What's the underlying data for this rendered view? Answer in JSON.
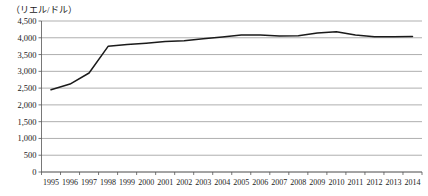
{
  "chart_data": {
    "type": "line",
    "title": "",
    "subtitle": "",
    "unit_label": "（リエル/ドル）",
    "xlabel": "",
    "ylabel": "",
    "grid": true,
    "legend": false,
    "legend_position": "none",
    "ylim": [
      0,
      4500
    ],
    "ytick_labels": [
      "4,500",
      "4,000",
      "3,500",
      "3,000",
      "2,500",
      "2,000",
      "1,500",
      "1,000",
      "500",
      "0"
    ],
    "ytick_values": [
      4500,
      4000,
      3500,
      3000,
      2500,
      2000,
      1500,
      1000,
      500,
      0
    ],
    "categories": [
      "1995",
      "1996",
      "1997",
      "1998",
      "1999",
      "2000",
      "2001",
      "2002",
      "2003",
      "2004",
      "2005",
      "2006",
      "2007",
      "2008",
      "2009",
      "2010",
      "2011",
      "2012",
      "2013",
      "2014"
    ],
    "x": [
      1995,
      1996,
      1997,
      1998,
      1999,
      2000,
      2001,
      2002,
      2003,
      2004,
      2005,
      2006,
      2007,
      2008,
      2009,
      2010,
      2011,
      2012,
      2013,
      2014
    ],
    "values": [
      2450,
      2620,
      2950,
      3745,
      3800,
      3840,
      3890,
      3910,
      3970,
      4020,
      4080,
      4080,
      4050,
      4060,
      4140,
      4180,
      4080,
      4030,
      4030,
      4040
    ],
    "series": [
      {
        "name": "リエル/ドル為替レート",
        "color": "#1a1a1a",
        "values": [
          2450,
          2620,
          2950,
          3745,
          3800,
          3840,
          3890,
          3910,
          3970,
          4020,
          4080,
          4080,
          4050,
          4060,
          4140,
          4180,
          4080,
          4030,
          4030,
          4040
        ]
      }
    ],
    "annotations": []
  },
  "colors": {
    "line": "#1a1a1a",
    "grid": "#8c8c8c",
    "axis": "#555555",
    "background": "#ffffff",
    "text": "#1a1a1a"
  }
}
